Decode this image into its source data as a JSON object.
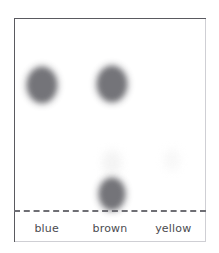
{
  "figure": {
    "plate_border_color": "#5a5a60",
    "baseline_color": "#6e6e74",
    "background_color": "#ffffff",
    "label_color": "#4b4b50"
  },
  "lanes": [
    {
      "label": "blue"
    },
    {
      "label": "brown"
    },
    {
      "label": "yellow"
    }
  ],
  "chart_data": {
    "type": "scatter",
    "xlabel": "",
    "ylabel": "",
    "grid": false,
    "legend": "none",
    "categories": [
      "blue",
      "brown",
      "yellow"
    ],
    "baseline_y_px": 210,
    "solvent_front_y_px": 19,
    "series": [
      {
        "name": "blue",
        "lane": 0,
        "spots": [
          {
            "label": "blue spot",
            "rf": 0.66,
            "center_x_px": 42,
            "center_y_px": 85,
            "width_px": 27,
            "height_px": 33,
            "color": "#6d6d72",
            "intensity": "strong"
          }
        ]
      },
      {
        "name": "brown",
        "lane": 1,
        "spots": [
          {
            "label": "brown upper spot",
            "rf": 0.66,
            "center_x_px": 112,
            "center_y_px": 84,
            "width_px": 27,
            "height_px": 33,
            "color": "#6d6d72",
            "intensity": "strong"
          },
          {
            "label": "brown faint middle spot",
            "rf": 0.28,
            "center_x_px": 112,
            "center_y_px": 163,
            "width_px": 20,
            "height_px": 26,
            "color": "#f3f3f3",
            "intensity": "very-faint"
          },
          {
            "label": "brown lower spot",
            "rf": 0.09,
            "center_x_px": 112,
            "center_y_px": 194,
            "width_px": 23,
            "height_px": 29,
            "color": "#6d6d72",
            "intensity": "strong"
          }
        ]
      },
      {
        "name": "yellow",
        "lane": 2,
        "spots": [
          {
            "label": "yellow faint spot",
            "rf": 0.3,
            "center_x_px": 172,
            "center_y_px": 160,
            "width_px": 16,
            "height_px": 22,
            "color": "#f7f7f7",
            "intensity": "very-faint"
          }
        ]
      }
    ]
  }
}
